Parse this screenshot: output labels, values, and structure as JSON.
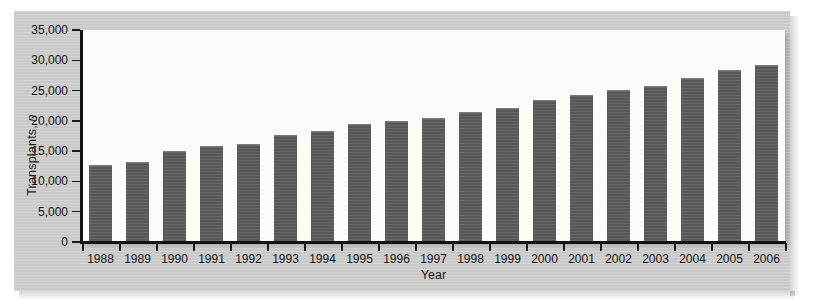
{
  "figure": {
    "background_color": "#c9c9c9",
    "plot_background_color": "#fbfbfa",
    "bar_color": "#5c5c5c"
  },
  "chart_data": {
    "type": "bar",
    "title": "",
    "subtitle": "",
    "xlabel": "Year",
    "ylabel": "Transplants, n",
    "ylabel_italic_part": "n",
    "categories": [
      "1988",
      "1989",
      "1990",
      "1991",
      "1992",
      "1993",
      "1994",
      "1995",
      "1996",
      "1997",
      "1998",
      "1999",
      "2000",
      "2001",
      "2002",
      "2003",
      "2004",
      "2005",
      "2006"
    ],
    "values": [
      12700,
      13200,
      15100,
      15800,
      16200,
      17700,
      18400,
      19400,
      19900,
      20400,
      21500,
      22200,
      23400,
      24200,
      25100,
      25700,
      27100,
      28400,
      29300
    ],
    "series": [
      {
        "name": "Transplants",
        "values": [
          12700,
          13200,
          15100,
          15800,
          16200,
          17700,
          18400,
          19400,
          19900,
          20400,
          21500,
          22200,
          23400,
          24200,
          25100,
          25700,
          27100,
          28400,
          29300
        ]
      }
    ],
    "ylim": [
      0,
      35000
    ],
    "ytick_values": [
      0,
      5000,
      10000,
      15000,
      20000,
      25000,
      30000,
      35000
    ],
    "ytick_labels": [
      "0",
      "5,000",
      "10,000",
      "15,000",
      "20,000",
      "25,000",
      "30,000",
      "35,000"
    ],
    "grid": false,
    "legend": null,
    "legend_position": "none",
    "orientation": "vertical"
  }
}
